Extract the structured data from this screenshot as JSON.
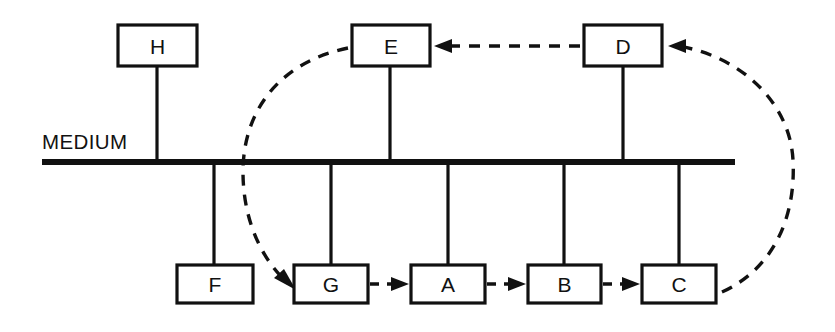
{
  "diagram": {
    "title": "MEDIUM",
    "type": "bus-network-token-passing",
    "bus": {
      "label": "MEDIUM",
      "label_position": {
        "x": 42,
        "y": 149
      },
      "line": {
        "x1": 42,
        "y1": 162,
        "x2": 735,
        "y2": 162,
        "width": 6
      }
    },
    "nodes": [
      {
        "id": "H",
        "label": "H",
        "x": 118,
        "y": 25,
        "w": 79,
        "h": 41,
        "side": "above",
        "stem_x": 157,
        "stem_y1": 66,
        "stem_y2": 162
      },
      {
        "id": "E",
        "label": "E",
        "x": 352,
        "y": 25,
        "w": 78,
        "h": 41,
        "side": "above",
        "stem_x": 390,
        "stem_y1": 66,
        "stem_y2": 162
      },
      {
        "id": "D",
        "label": "D",
        "x": 584,
        "y": 25,
        "w": 78,
        "h": 41,
        "side": "above",
        "stem_x": 623,
        "stem_y1": 66,
        "stem_y2": 162
      },
      {
        "id": "F",
        "label": "F",
        "x": 177,
        "y": 265,
        "w": 76,
        "h": 38,
        "side": "below",
        "stem_x": 214,
        "stem_y1": 162,
        "stem_y2": 265
      },
      {
        "id": "G",
        "label": "G",
        "x": 294,
        "y": 265,
        "w": 74,
        "h": 38,
        "side": "below",
        "stem_x": 331,
        "stem_y1": 162,
        "stem_y2": 265
      },
      {
        "id": "A",
        "label": "A",
        "x": 411,
        "y": 265,
        "w": 74,
        "h": 38,
        "side": "below",
        "stem_x": 448,
        "stem_y1": 162,
        "stem_y2": 265
      },
      {
        "id": "B",
        "label": "B",
        "x": 528,
        "y": 265,
        "w": 73,
        "h": 38,
        "side": "below",
        "stem_x": 564,
        "stem_y1": 162,
        "stem_y2": 265
      },
      {
        "id": "C",
        "label": "C",
        "x": 642,
        "y": 265,
        "w": 74,
        "h": 38,
        "side": "below",
        "stem_x": 679,
        "stem_y1": 162,
        "stem_y2": 265
      }
    ],
    "token_flows": [
      {
        "id": "flow-D-to-E",
        "from": "D",
        "to": "E",
        "style": "dashed",
        "kind": "straight",
        "path": "M 580 46 L 440 46"
      },
      {
        "id": "flow-E-to-G",
        "from": "E",
        "to": "G",
        "style": "dashed",
        "kind": "curved-left",
        "path": "M 348 48 C 280 62 243 110 243 172 C 243 228 268 266 288 283"
      },
      {
        "id": "flow-G-to-A",
        "from": "G",
        "to": "A",
        "style": "dashed",
        "kind": "straight",
        "path": "M 370 284 L 403 284"
      },
      {
        "id": "flow-A-to-B",
        "from": "A",
        "to": "B",
        "style": "dashed",
        "kind": "straight",
        "path": "M 487 284 L 520 284"
      },
      {
        "id": "flow-B-to-C",
        "from": "B",
        "to": "C",
        "style": "dashed",
        "kind": "straight",
        "path": "M 603 284 L 634 284"
      },
      {
        "id": "flow-C-to-D",
        "from": "C",
        "to": "D",
        "style": "dashed",
        "kind": "curved-right",
        "path": "M 722 292 C 775 268 796 215 793 160 C 790 102 740 56 678 46"
      }
    ],
    "arrow_heads": [
      {
        "id": "arrow-into-E",
        "x": 434,
        "y": 46,
        "dir": "left"
      },
      {
        "id": "arrow-into-G",
        "x": 292,
        "y": 287,
        "dir": "down-right"
      },
      {
        "id": "arrow-into-A",
        "x": 407,
        "y": 284,
        "dir": "right"
      },
      {
        "id": "arrow-into-B",
        "x": 524,
        "y": 284,
        "dir": "right"
      },
      {
        "id": "arrow-into-C",
        "x": 638,
        "y": 284,
        "dir": "right"
      },
      {
        "id": "arrow-into-D",
        "x": 668,
        "y": 46,
        "dir": "left"
      }
    ],
    "colors": {
      "background": "#ffffff",
      "stroke": "#111111",
      "node_fill": "#ffffff"
    }
  }
}
